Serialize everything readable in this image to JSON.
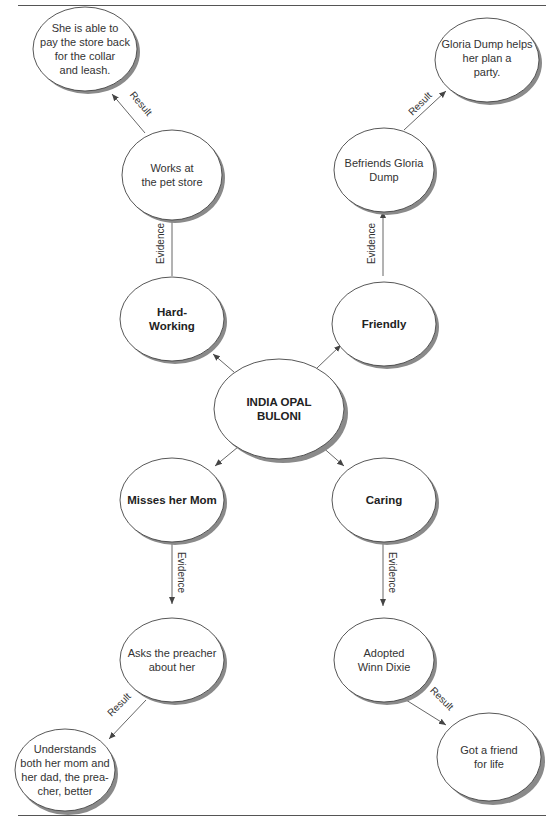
{
  "diagram": {
    "center": {
      "id": "center",
      "label": "INDIA OPAL BULONI",
      "lines": [
        "INDIA OPAL",
        "BULONI"
      ]
    },
    "traits": [
      {
        "id": "hard-working",
        "lines": [
          "Hard-",
          "Working"
        ],
        "label": "Hard-Working"
      },
      {
        "id": "friendly",
        "lines": [
          "Friendly"
        ],
        "label": "Friendly"
      },
      {
        "id": "misses-mom",
        "lines": [
          "Misses her Mom"
        ],
        "label": "Misses her Mom"
      },
      {
        "id": "caring",
        "lines": [
          "Caring"
        ],
        "label": "Caring"
      }
    ],
    "evidence": [
      {
        "id": "pet-store",
        "lines": [
          "Works at",
          "the pet store"
        ]
      },
      {
        "id": "gloria",
        "lines": [
          "Befriends Gloria",
          "Dump"
        ]
      },
      {
        "id": "preacher",
        "lines": [
          "Asks the preacher",
          "about her"
        ]
      },
      {
        "id": "winn-dixie",
        "lines": [
          "Adopted",
          "Winn Dixie"
        ]
      }
    ],
    "results": [
      {
        "id": "pay-back",
        "lines": [
          "She is able to",
          "pay the store back",
          "for the collar",
          "and leash."
        ]
      },
      {
        "id": "party",
        "lines": [
          "Gloria Dump helps",
          "her plan a",
          "party."
        ]
      },
      {
        "id": "understands",
        "lines": [
          "Understands",
          "both her mom and",
          "her dad, the prea-",
          "cher, better"
        ]
      },
      {
        "id": "friend",
        "lines": [
          "Got a friend",
          "for life"
        ]
      }
    ],
    "edge_labels": {
      "evidence": "Evidence",
      "result": "Result"
    },
    "edges": [
      {
        "from": "center",
        "to": "hard-working",
        "label": ""
      },
      {
        "from": "center",
        "to": "friendly",
        "label": ""
      },
      {
        "from": "center",
        "to": "misses-mom",
        "label": ""
      },
      {
        "from": "center",
        "to": "caring",
        "label": ""
      },
      {
        "from": "hard-working",
        "to": "pet-store",
        "label": "Evidence"
      },
      {
        "from": "friendly",
        "to": "gloria",
        "label": "Evidence"
      },
      {
        "from": "misses-mom",
        "to": "preacher",
        "label": "Evidence"
      },
      {
        "from": "caring",
        "to": "winn-dixie",
        "label": "Evidence"
      },
      {
        "from": "pet-store",
        "to": "pay-back",
        "label": "Result"
      },
      {
        "from": "gloria",
        "to": "party",
        "label": "Result"
      },
      {
        "from": "preacher",
        "to": "understands",
        "label": "Result"
      },
      {
        "from": "winn-dixie",
        "to": "friend",
        "label": "Result"
      }
    ]
  },
  "colors": {
    "stroke": "#444444",
    "shadow": "#8a8a8a",
    "fill": "#ffffff",
    "text": "#333333"
  }
}
